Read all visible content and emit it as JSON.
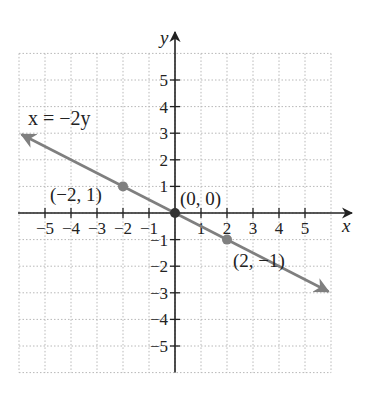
{
  "chart_data": {
    "type": "line",
    "title": "",
    "xlabel": "x",
    "ylabel": "y",
    "xlim": [
      -6,
      6
    ],
    "ylim": [
      -6,
      6
    ],
    "grid": true,
    "x_ticks": [
      -5,
      -4,
      -3,
      -2,
      -1,
      1,
      2,
      3,
      4,
      5
    ],
    "y_ticks": [
      -5,
      -4,
      -3,
      -2,
      -1,
      1,
      2,
      3,
      4,
      5
    ],
    "x_tick_labels": [
      "−5",
      "−4",
      "−3",
      "−2",
      "−1",
      "1",
      "2",
      "3",
      "4",
      "5"
    ],
    "y_tick_labels": [
      "−5",
      "−4",
      "−3",
      "−2",
      "−1",
      "1",
      "2",
      "3",
      "4",
      "5"
    ],
    "series": [
      {
        "name": "x = −2y",
        "equation": "x = -2y",
        "slope": -0.5,
        "intercept": 0,
        "x": [
          -5.9,
          5.9
        ],
        "y": [
          2.95,
          -2.95
        ],
        "color": "#7f7f7f",
        "arrows": "both"
      }
    ],
    "points": [
      {
        "x": -2,
        "y": 1,
        "label": "(−2, 1)"
      },
      {
        "x": 0,
        "y": 0,
        "label": "(0, 0)"
      },
      {
        "x": 2,
        "y": -1,
        "label": "(2, −1)"
      }
    ],
    "annotations": [
      {
        "text": "x = −2y",
        "near": [
          -5,
          3.5
        ]
      }
    ]
  },
  "colors": {
    "axis": "#222222",
    "grid": "#b8b8b8",
    "line": "#7f7f7f",
    "origin_point": "#333333",
    "points": "#808080"
  }
}
